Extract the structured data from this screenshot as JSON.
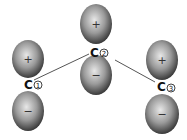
{
  "diagram": {
    "type": "p-orbital allyl system",
    "atoms": [
      {
        "id": "c1",
        "label": "C",
        "number": "1",
        "top_sign": "+",
        "bottom_sign": "−"
      },
      {
        "id": "c2",
        "label": "C",
        "number": "2",
        "top_sign": "+",
        "bottom_sign": "−"
      },
      {
        "id": "c3",
        "label": "C",
        "number": "3",
        "top_sign": "+",
        "bottom_sign": "−"
      }
    ],
    "bonds": [
      [
        "c1",
        "c2"
      ],
      [
        "c2",
        "c3"
      ]
    ]
  }
}
